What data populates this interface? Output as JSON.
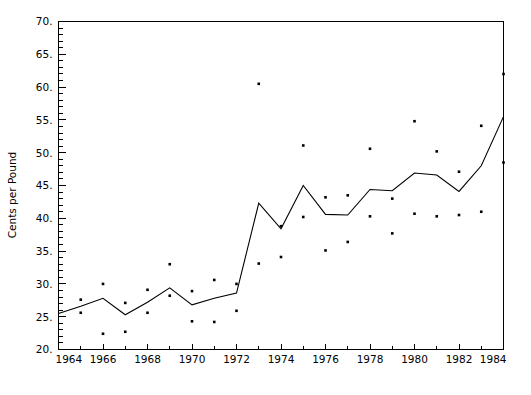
{
  "chart_data": {
    "type": "scatter",
    "title": "",
    "xlabel": "",
    "ylabel": "Cents per Pound",
    "xlim": [
      1964,
      1984
    ],
    "ylim": [
      20,
      70
    ],
    "grid": false,
    "legend": "none",
    "x_tick_labels": [
      "1964",
      "1966",
      "1968",
      "1970",
      "1972",
      "1974",
      "1976",
      "1978",
      "1980",
      "1982",
      "1984"
    ],
    "x_tick_values": [
      1964,
      1966,
      1968,
      1970,
      1972,
      1974,
      1976,
      1978,
      1980,
      1982,
      1984
    ],
    "x_minor_tick_values": [
      1965,
      1967,
      1969,
      1971,
      1973,
      1975,
      1977,
      1979,
      1981,
      1983
    ],
    "y_tick_labels": [
      "20.",
      "25.",
      "30.",
      "35.",
      "40.",
      "45.",
      "50.",
      "55.",
      "60.",
      "65.",
      "70."
    ],
    "y_tick_values": [
      20,
      25,
      30,
      35,
      40,
      45,
      50,
      55,
      60,
      65,
      70
    ],
    "y_minor_step": 1,
    "series": [
      {
        "name": "annual average",
        "render": "line",
        "x": [
          1964,
          1965,
          1966,
          1967,
          1968,
          1969,
          1970,
          1971,
          1972,
          1973,
          1974,
          1975,
          1976,
          1977,
          1978,
          1979,
          1980,
          1981,
          1982,
          1983,
          1984
        ],
        "values": [
          25.5,
          26.6,
          27.8,
          25.3,
          27.2,
          29.4,
          26.8,
          27.8,
          28.6,
          42.3,
          38.4,
          45.0,
          40.6,
          40.5,
          44.4,
          44.2,
          46.9,
          46.6,
          44.1,
          48.0,
          55.5
        ]
      },
      {
        "name": "high observations",
        "render": "points",
        "x": [
          1965,
          1966,
          1967,
          1968,
          1969,
          1970,
          1971,
          1972,
          1973,
          1974,
          1975,
          1976,
          1977,
          1978,
          1979,
          1980,
          1981,
          1982,
          1983,
          1984
        ],
        "values": [
          27.6,
          30.0,
          27.1,
          29.1,
          33.0,
          28.9,
          30.6,
          30.0,
          60.5,
          38.8,
          51.1,
          43.2,
          43.5,
          50.6,
          43.0,
          54.8,
          50.2,
          47.1,
          54.1,
          62.0
        ]
      },
      {
        "name": "low observations",
        "render": "points",
        "x": [
          1965,
          1966,
          1967,
          1968,
          1969,
          1970,
          1971,
          1972,
          1973,
          1974,
          1975,
          1976,
          1977,
          1978,
          1979,
          1980,
          1981,
          1982,
          1983,
          1984
        ],
        "values": [
          25.6,
          22.4,
          22.7,
          25.6,
          28.2,
          24.3,
          24.2,
          25.9,
          33.1,
          34.1,
          40.2,
          35.1,
          36.4,
          40.3,
          37.7,
          40.7,
          40.3,
          40.5,
          41.0,
          48.5
        ]
      }
    ]
  }
}
